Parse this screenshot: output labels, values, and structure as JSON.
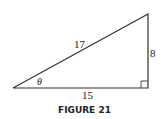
{
  "figure": {
    "caption": "FIGURE 21",
    "labels": {
      "hypotenuse": "17",
      "opposite": "8",
      "adjacent": "15",
      "angle": "θ"
    },
    "right_angle_marker": true,
    "stroke_color": "#333333"
  }
}
